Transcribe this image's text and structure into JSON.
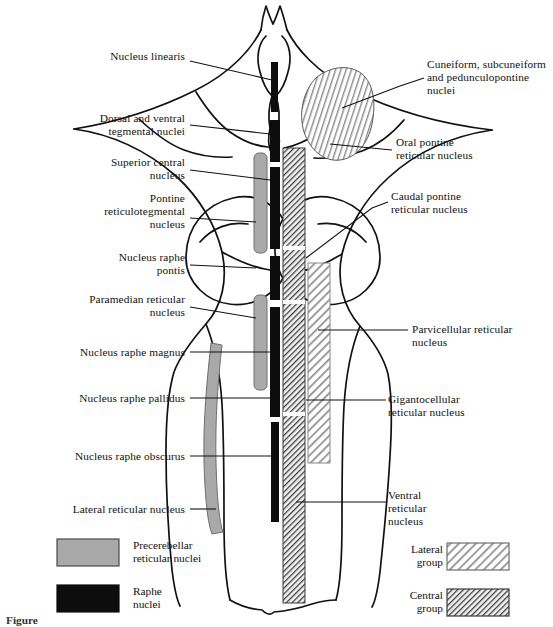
{
  "figure": {
    "caption_partial": "Figure"
  },
  "colors": {
    "outline": "#111111",
    "leader": "#111111",
    "precerebellar_gray": "#a9a9a9",
    "raphe_black": "#0d0d0d",
    "lateral_group_hatch": "#9c9c9c",
    "central_group_hatch": "#555555",
    "background": "#ffffff"
  },
  "labels_left": [
    {
      "id": "nucleus-linearis",
      "text": "Nucleus linearis",
      "x": 75,
      "y": 57,
      "w": 110,
      "lines": 1
    },
    {
      "id": "dorsal-ventral-tegmental",
      "text": "Dorsal and ventral\ntegmental nuclei",
      "x": 61,
      "y": 119,
      "w": 124,
      "lines": 2
    },
    {
      "id": "superior-central-nucleus",
      "text": "Superior central\nnucleus",
      "x": 73,
      "y": 163,
      "w": 112,
      "lines": 2
    },
    {
      "id": "pontine-reticulotegmental",
      "text": "Pontine\nreticulotegmental\nnucleus",
      "x": 30,
      "y": 199,
      "w": 155,
      "lines": 3
    },
    {
      "id": "nucleus-raphe-pontis",
      "text": "Nucleus raphe\npontis",
      "x": 74,
      "y": 257,
      "w": 111,
      "lines": 2
    },
    {
      "id": "paramedian-reticular",
      "text": "Paramedian reticular\nnucleus",
      "x": 4,
      "y": 294,
      "w": 181,
      "lines": 2
    },
    {
      "id": "nucleus-raphe-magnus",
      "text": "Nucleus raphe magnus",
      "x": 47,
      "y": 346,
      "w": 138,
      "lines": 1
    },
    {
      "id": "nucleus-raphe-pallidus",
      "text": "Nucleus raphe pallidus",
      "x": 50,
      "y": 392,
      "w": 135,
      "lines": 1
    },
    {
      "id": "nucleus-raphe-obscurus",
      "text": "Nucleus raphe obscurus",
      "x": 43,
      "y": 450,
      "w": 142,
      "lines": 1
    },
    {
      "id": "lateral-reticular-nucleus",
      "text": "Lateral reticular nucleus",
      "x": 33,
      "y": 503,
      "w": 152,
      "lines": 1
    }
  ],
  "labels_right": [
    {
      "id": "cuneiform-subcuneiform",
      "text": "Cuneiform, subcuneiform\nand pedunculopontine\nnuclei",
      "x": 427,
      "y": 63,
      "lines": 3
    },
    {
      "id": "oral-pontine-reticular",
      "text": "Oral pontine\nreticular nucleus",
      "x": 396,
      "y": 142,
      "lines": 2
    },
    {
      "id": "caudal-pontine-reticular",
      "text": "Caudal pontine\nreticular nucleus",
      "x": 391,
      "y": 196,
      "lines": 2
    },
    {
      "id": "parvicellular-reticular",
      "text": "Parvicellular reticular\nnucleus",
      "x": 412,
      "y": 324,
      "lines": 2
    },
    {
      "id": "gigantocellular-reticular",
      "text": "Gigantocellular\nreticular nucleus",
      "x": 388,
      "y": 394,
      "lines": 2
    },
    {
      "id": "ventral-reticular",
      "text": "Ventral\nreticular\nnucleus",
      "x": 388,
      "y": 489,
      "lines": 3
    }
  ],
  "legend": {
    "left": [
      {
        "id": "precerebellar-reticular-nuclei",
        "text": "Precerebellar\nreticular nuclei",
        "style": "solid-gray",
        "swatch": {
          "x": 57,
          "y": 539,
          "w": 62,
          "h": 27
        }
      },
      {
        "id": "raphe-nuclei",
        "text": "Raphe\nnuclei",
        "style": "solid-black",
        "swatch": {
          "x": 57,
          "y": 585,
          "w": 62,
          "h": 27
        }
      }
    ],
    "right": [
      {
        "id": "lateral-group",
        "text": "Lateral\ngroup",
        "style": "hatch-light",
        "swatch": {
          "x": 447,
          "y": 543,
          "w": 62,
          "h": 27
        }
      },
      {
        "id": "central-group",
        "text": "Central\ngroup",
        "style": "hatch-dark",
        "swatch": {
          "x": 447,
          "y": 589,
          "w": 62,
          "h": 27
        }
      }
    ]
  },
  "structures": {
    "raphe_column_segments": [
      {
        "id": "nucleus-linearis-bar",
        "x": 271,
        "y": 62,
        "w": 7,
        "h": 50
      },
      {
        "id": "dorsal-ventral-tegmental-bar",
        "x": 270,
        "y": 120,
        "w": 10,
        "h": 42
      },
      {
        "id": "superior-central-bar",
        "x": 270,
        "y": 167,
        "w": 10,
        "h": 82
      },
      {
        "id": "nucleus-raphe-pontis-bar",
        "x": 270,
        "y": 256,
        "w": 10,
        "h": 44
      },
      {
        "id": "nucleus-raphe-magnus-bar",
        "x": 270,
        "y": 307,
        "w": 10,
        "h": 110
      },
      {
        "id": "nucleus-raphe-obscurus-bar",
        "x": 271,
        "y": 422,
        "w": 8,
        "h": 100
      }
    ],
    "precerebellar_bars": [
      {
        "id": "pontine-reticulotegmental-bar",
        "x": 254,
        "y": 153,
        "w": 13,
        "h": 100
      },
      {
        "id": "paramedian-reticular-bar",
        "x": 254,
        "y": 295,
        "w": 13,
        "h": 95
      },
      {
        "id": "lateral-reticular-bar",
        "x": 205,
        "y": 343,
        "w": 13,
        "h": 185
      }
    ],
    "central_group_column": {
      "id": "central-group-column",
      "x": 283,
      "y": 148,
      "w": 22,
      "h": 455
    },
    "lateral_group_column": {
      "id": "lateral-group-column",
      "x": 308,
      "y": 263,
      "w": 22,
      "h": 200
    },
    "cuneiform_patch": {
      "id": "cuneiform-patch"
    }
  }
}
